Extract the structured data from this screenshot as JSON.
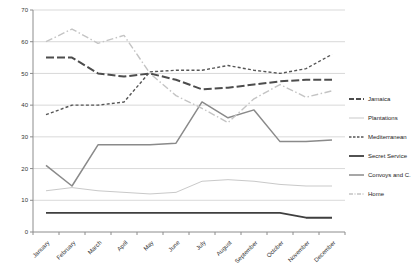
{
  "chart_data": {
    "type": "line",
    "title": "",
    "xlabel": "",
    "ylabel": "",
    "ylim": [
      0,
      70
    ],
    "y_ticks": [
      0,
      10,
      20,
      30,
      40,
      50,
      60,
      70
    ],
    "grid": "horizontal",
    "legend_position": "right",
    "categories": [
      "January",
      "February",
      "March",
      "April",
      "May",
      "June",
      "July",
      "August",
      "September",
      "October",
      "November",
      "December"
    ],
    "series": [
      {
        "name": "Jamaica",
        "style": "long-dash",
        "color": "#4d4d4d",
        "width": 2,
        "values": [
          55,
          55,
          50,
          49,
          50,
          48,
          45,
          45.5,
          46.5,
          47.5,
          48,
          48
        ]
      },
      {
        "name": "Plantations",
        "style": "solid",
        "color": "#c9c9c9",
        "width": 1,
        "values": [
          13,
          14,
          13,
          12.5,
          12,
          12.5,
          16,
          16.5,
          16,
          15,
          14.5,
          14.5
        ]
      },
      {
        "name": "Mediterranean",
        "style": "short-dash",
        "color": "#555555",
        "width": 1.4,
        "values": [
          37,
          40,
          40,
          41,
          50.5,
          51,
          51,
          52.5,
          51,
          50,
          51.5,
          56
        ]
      },
      {
        "name": "Secret Service",
        "style": "solid",
        "color": "#3f3f3f",
        "width": 1.8,
        "values": [
          6,
          6,
          6,
          6,
          6,
          6,
          6,
          6,
          6,
          6,
          4.5,
          4.5
        ]
      },
      {
        "name": "Convoys and C.",
        "style": "solid",
        "color": "#8a8a8a",
        "width": 1.5,
        "values": [
          21,
          14.5,
          27.5,
          27.5,
          27.5,
          28,
          41,
          36,
          38.5,
          28.5,
          28.5,
          29
        ]
      },
      {
        "name": "Home",
        "style": "dash-dot",
        "color": "#c4c4c4",
        "width": 1.4,
        "values": [
          60,
          64,
          59.5,
          62,
          50,
          43,
          39,
          34.5,
          42,
          46.5,
          42.5,
          44.5
        ]
      }
    ],
    "colors": {
      "gridline": "#d9d9d9",
      "axis": "#8c8c8c",
      "tick_text": "#333333",
      "background": "#ffffff"
    }
  }
}
